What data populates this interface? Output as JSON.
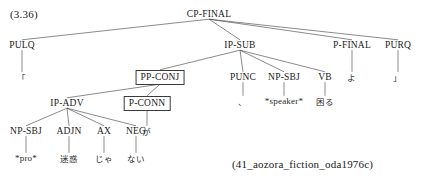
{
  "figure": {
    "number_label": "(3.36)",
    "citation": "(41_aozora_fiction_oda1976c)",
    "type": "syntax-tree",
    "language": "Japanese",
    "line_color": "#3c3c3c",
    "text_color": "#1a1a1a",
    "background": "#ffffff"
  },
  "tree": {
    "root": "CP-FINAL",
    "nodes": [
      {
        "id": "cp-final",
        "label": "CP-FINAL",
        "x": 209,
        "y": 14,
        "boxed": false,
        "kind": "nonterminal"
      },
      {
        "id": "pulq",
        "label": "PULQ",
        "x": 22,
        "y": 45,
        "boxed": false,
        "kind": "nonterminal"
      },
      {
        "id": "ip-sub",
        "label": "IP-SUB",
        "x": 240,
        "y": 45,
        "boxed": false,
        "kind": "nonterminal"
      },
      {
        "id": "p-final",
        "label": "P-FINAL",
        "x": 352,
        "y": 45,
        "boxed": false,
        "kind": "nonterminal"
      },
      {
        "id": "purq",
        "label": "PURQ",
        "x": 398,
        "y": 45,
        "boxed": false,
        "kind": "nonterminal"
      },
      {
        "id": "pp-conj",
        "label": "PP-CONJ",
        "x": 160,
        "y": 77,
        "boxed": true,
        "kind": "nonterminal"
      },
      {
        "id": "punc",
        "label": "PUNC",
        "x": 243,
        "y": 77,
        "boxed": false,
        "kind": "nonterminal"
      },
      {
        "id": "np-sbj-2",
        "label": "NP-SBJ",
        "x": 284,
        "y": 77,
        "boxed": false,
        "kind": "nonterminal"
      },
      {
        "id": "vb",
        "label": "VB",
        "x": 325,
        "y": 77,
        "boxed": false,
        "kind": "nonterminal"
      },
      {
        "id": "ip-adv",
        "label": "IP-ADV",
        "x": 67,
        "y": 103,
        "boxed": false,
        "kind": "nonterminal"
      },
      {
        "id": "p-conn",
        "label": "P-CONN",
        "x": 147,
        "y": 103,
        "boxed": true,
        "kind": "nonterminal"
      },
      {
        "id": "np-sbj-1",
        "label": "NP-SBJ",
        "x": 26,
        "y": 131,
        "boxed": false,
        "kind": "nonterminal"
      },
      {
        "id": "adjn",
        "label": "ADJN",
        "x": 69,
        "y": 131,
        "boxed": false,
        "kind": "nonterminal"
      },
      {
        "id": "ax",
        "label": "AX",
        "x": 104,
        "y": 131,
        "boxed": false,
        "kind": "nonterminal"
      },
      {
        "id": "neg",
        "label": "NEG",
        "x": 136,
        "y": 131,
        "boxed": false,
        "kind": "nonterminal"
      }
    ],
    "terminals": [
      {
        "id": "t-pulq",
        "label": "「",
        "x": 22,
        "y": 77,
        "parent": "pulq"
      },
      {
        "id": "t-punc",
        "label": "、",
        "x": 243,
        "y": 101,
        "parent": "punc"
      },
      {
        "id": "t-spk",
        "label": "*speaker*",
        "x": 284,
        "y": 101,
        "parent": "np-sbj-2"
      },
      {
        "id": "t-vb",
        "label": "困る",
        "x": 325,
        "y": 101,
        "parent": "vb"
      },
      {
        "id": "t-final",
        "label": "よ",
        "x": 352,
        "y": 77,
        "parent": "p-final"
      },
      {
        "id": "t-purq",
        "label": "」",
        "x": 398,
        "y": 77,
        "parent": "purq"
      },
      {
        "id": "t-conn",
        "label": "が",
        "x": 147,
        "y": 131,
        "parent": "p-conn"
      },
      {
        "id": "t-pro",
        "label": "*pro*",
        "x": 26,
        "y": 158,
        "parent": "np-sbj-1"
      },
      {
        "id": "t-adjn",
        "label": "迷惑",
        "x": 69,
        "y": 158,
        "parent": "adjn"
      },
      {
        "id": "t-ax",
        "label": "じゃ",
        "x": 104,
        "y": 158,
        "parent": "ax"
      },
      {
        "id": "t-neg",
        "label": "ない",
        "x": 136,
        "y": 158,
        "parent": "neg"
      }
    ],
    "edges": [
      {
        "from": "cp-final",
        "to": "pulq"
      },
      {
        "from": "cp-final",
        "to": "ip-sub"
      },
      {
        "from": "cp-final",
        "to": "p-final"
      },
      {
        "from": "cp-final",
        "to": "purq"
      },
      {
        "from": "ip-sub",
        "to": "pp-conj"
      },
      {
        "from": "ip-sub",
        "to": "punc"
      },
      {
        "from": "ip-sub",
        "to": "np-sbj-2"
      },
      {
        "from": "ip-sub",
        "to": "vb"
      },
      {
        "from": "pp-conj",
        "to": "ip-adv"
      },
      {
        "from": "pp-conj",
        "to": "p-conn"
      },
      {
        "from": "ip-adv",
        "to": "np-sbj-1"
      },
      {
        "from": "ip-adv",
        "to": "adjn"
      },
      {
        "from": "ip-adv",
        "to": "ax"
      },
      {
        "from": "ip-adv",
        "to": "neg"
      },
      {
        "from": "pulq",
        "to": "t-pulq"
      },
      {
        "from": "punc",
        "to": "t-punc"
      },
      {
        "from": "np-sbj-2",
        "to": "t-spk"
      },
      {
        "from": "vb",
        "to": "t-vb"
      },
      {
        "from": "p-final",
        "to": "t-final"
      },
      {
        "from": "purq",
        "to": "t-purq"
      },
      {
        "from": "p-conn",
        "to": "t-conn"
      },
      {
        "from": "np-sbj-1",
        "to": "t-pro"
      },
      {
        "from": "adjn",
        "to": "t-adjn"
      },
      {
        "from": "ax",
        "to": "t-ax"
      },
      {
        "from": "neg",
        "to": "t-neg"
      }
    ]
  }
}
